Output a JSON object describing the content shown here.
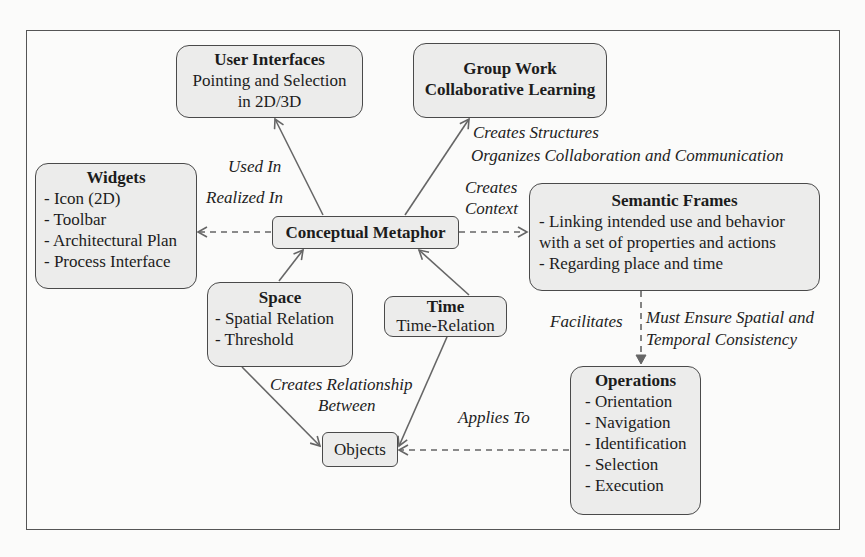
{
  "diagram": {
    "nodes": {
      "user_interfaces": {
        "title": "User Interfaces",
        "lines": [
          "Pointing and Selection",
          "in 2D/3D"
        ]
      },
      "group_work": {
        "title": "Group Work",
        "lines": [
          "Collaborative Learning"
        ]
      },
      "widgets": {
        "title": "Widgets",
        "lines": [
          "- Icon (2D)",
          "- Toolbar",
          "- Architectural Plan",
          "- Process Interface"
        ]
      },
      "conceptual_metaphor": {
        "title": "Conceptual Metaphor"
      },
      "semantic_frames": {
        "title": "Semantic Frames",
        "lines": [
          "- Linking intended use and behavior",
          "with a set of properties and actions",
          "- Regarding place and time"
        ]
      },
      "space": {
        "title": "Space",
        "lines": [
          "- Spatial Relation",
          "- Threshold"
        ]
      },
      "time": {
        "title": "Time",
        "lines": [
          "Time-Relation"
        ]
      },
      "objects": {
        "title": "Objects"
      },
      "operations": {
        "title": "Operations",
        "lines": [
          "- Orientation",
          "- Navigation",
          "- Identification",
          "- Selection",
          "- Execution"
        ]
      }
    },
    "edge_labels": {
      "used_in": "Used In",
      "realized_in": "Realized In",
      "creates_structures": "Creates Structures",
      "organizes": "Organizes Collaboration and Communication",
      "creates_context_1": "Creates",
      "creates_context_2": "Context",
      "facilitates": "Facilitates",
      "must_ensure_1": "Must Ensure Spatial and",
      "must_ensure_2": "Temporal Consistency",
      "creates_relationship_1": "Creates Relationship",
      "creates_relationship_2": "Between",
      "applies_to": "Applies To"
    },
    "edges": [
      {
        "from": "conceptual_metaphor",
        "to": "user_interfaces",
        "style": "solid",
        "label": "Used In"
      },
      {
        "from": "conceptual_metaphor",
        "to": "group_work",
        "style": "solid",
        "label": "Creates Structures / Organizes Collaboration and Communication"
      },
      {
        "from": "conceptual_metaphor",
        "to": "widgets",
        "style": "dashed",
        "label": "Realized In"
      },
      {
        "from": "conceptual_metaphor",
        "to": "semantic_frames",
        "style": "dashed",
        "label": "Creates Context"
      },
      {
        "from": "space",
        "to": "conceptual_metaphor",
        "style": "solid"
      },
      {
        "from": "time",
        "to": "conceptual_metaphor",
        "style": "solid"
      },
      {
        "from": "semantic_frames",
        "to": "operations",
        "style": "dashed",
        "label": "Facilitates / Must Ensure Spatial and Temporal Consistency"
      },
      {
        "from": "space",
        "to": "objects",
        "style": "solid",
        "label": "Creates Relationship Between"
      },
      {
        "from": "time",
        "to": "objects",
        "style": "solid"
      },
      {
        "from": "operations",
        "to": "objects",
        "style": "dashed",
        "label": "Applies To"
      }
    ],
    "colors": {
      "node_fill": "#ececeb",
      "node_border": "#4a4a4a",
      "edge": "#666666",
      "background": "#fbfbfa"
    }
  }
}
